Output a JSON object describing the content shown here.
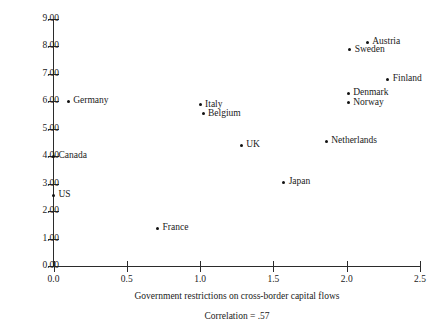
{
  "chart_data": {
    "type": "scatter",
    "title": "",
    "xlabel": "Government restrictions on cross-border capital flows",
    "ylabel": "Left-labor power index",
    "xlim": [
      0.0,
      2.5
    ],
    "ylim": [
      0.0,
      9.0
    ],
    "xticks": [
      "0.0",
      "0.5",
      "1.0",
      "1.5",
      "2.0",
      "2.5"
    ],
    "xtick_values": [
      0.0,
      0.5,
      1.0,
      1.5,
      2.0,
      2.5
    ],
    "yticks": [
      "0.00",
      "1.00",
      "2.00",
      "3.00",
      "4.00",
      "5.00",
      "6.00",
      "7.00",
      "8.00",
      "9.00"
    ],
    "ytick_values": [
      0,
      1,
      2,
      3,
      4,
      5,
      6,
      7,
      8,
      9
    ],
    "grid": false,
    "legend": "none",
    "annotation": "Correlation  =  .57",
    "marker_color": "#111111",
    "axis_color": "#2b2b2b",
    "points": [
      {
        "label": "Germany",
        "x": 0.1,
        "y": 6.0,
        "label_side": "right"
      },
      {
        "label": "Canada",
        "x": 0.0,
        "y": 4.0,
        "label_side": "right"
      },
      {
        "label": "US",
        "x": 0.0,
        "y": 2.58,
        "label_side": "right"
      },
      {
        "label": "France",
        "x": 0.71,
        "y": 1.38,
        "label_side": "right"
      },
      {
        "label": "Italy",
        "x": 1.0,
        "y": 5.88,
        "label_side": "right"
      },
      {
        "label": "Belgium",
        "x": 1.02,
        "y": 5.54,
        "label_side": "right"
      },
      {
        "label": "UK",
        "x": 1.28,
        "y": 4.4,
        "label_side": "right"
      },
      {
        "label": "Japan",
        "x": 1.57,
        "y": 3.06,
        "label_side": "right"
      },
      {
        "label": "Netherlands",
        "x": 1.86,
        "y": 4.55,
        "label_side": "right"
      },
      {
        "label": "Sweden",
        "x": 2.02,
        "y": 7.88,
        "label_side": "right"
      },
      {
        "label": "Denmark",
        "x": 2.01,
        "y": 6.3,
        "label_side": "right"
      },
      {
        "label": "Norway",
        "x": 2.01,
        "y": 5.94,
        "label_side": "right"
      },
      {
        "label": "Austria",
        "x": 2.14,
        "y": 8.15,
        "label_side": "right"
      },
      {
        "label": "Finland",
        "x": 2.28,
        "y": 6.8,
        "label_side": "right"
      }
    ]
  }
}
